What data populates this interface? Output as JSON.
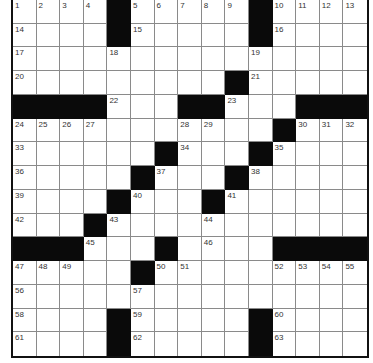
{
  "puzzle": {
    "rows": 15,
    "cols": 15,
    "colors": {
      "block": "#0a0a0a",
      "cell": "#ffffff",
      "gridline": "#8a8a8a",
      "border": "#111111"
    },
    "layout": [
      "....#.....#....",
      "....#.....#....",
      "...............",
      ".........#.....",
      "####...##...###",
      "...........#...",
      "......#...#....",
      ".....#...#.....",
      "....#...#......",
      "...#...........",
      "###...#....####",
      ".....#.........",
      "...............",
      "....#.....#....",
      "....#.....#...."
    ],
    "numbers": [
      {
        "r": 0,
        "c": 0,
        "n": "1"
      },
      {
        "r": 0,
        "c": 1,
        "n": "2"
      },
      {
        "r": 0,
        "c": 2,
        "n": "3"
      },
      {
        "r": 0,
        "c": 3,
        "n": "4"
      },
      {
        "r": 0,
        "c": 5,
        "n": "5"
      },
      {
        "r": 0,
        "c": 6,
        "n": "6"
      },
      {
        "r": 0,
        "c": 7,
        "n": "7"
      },
      {
        "r": 0,
        "c": 8,
        "n": "8"
      },
      {
        "r": 0,
        "c": 9,
        "n": "9"
      },
      {
        "r": 0,
        "c": 11,
        "n": "10"
      },
      {
        "r": 0,
        "c": 12,
        "n": "11"
      },
      {
        "r": 0,
        "c": 13,
        "n": "12"
      },
      {
        "r": 0,
        "c": 14,
        "n": "13"
      },
      {
        "r": 1,
        "c": 0,
        "n": "14"
      },
      {
        "r": 1,
        "c": 5,
        "n": "15"
      },
      {
        "r": 1,
        "c": 11,
        "n": "16"
      },
      {
        "r": 2,
        "c": 0,
        "n": "17"
      },
      {
        "r": 2,
        "c": 4,
        "n": "18"
      },
      {
        "r": 2,
        "c": 10,
        "n": "19"
      },
      {
        "r": 3,
        "c": 0,
        "n": "20"
      },
      {
        "r": 3,
        "c": 10,
        "n": "21"
      },
      {
        "r": 4,
        "c": 4,
        "n": "22"
      },
      {
        "r": 4,
        "c": 9,
        "n": "23"
      },
      {
        "r": 5,
        "c": 0,
        "n": "24"
      },
      {
        "r": 5,
        "c": 1,
        "n": "25"
      },
      {
        "r": 5,
        "c": 2,
        "n": "26"
      },
      {
        "r": 5,
        "c": 3,
        "n": "27"
      },
      {
        "r": 5,
        "c": 7,
        "n": "28"
      },
      {
        "r": 5,
        "c": 8,
        "n": "29"
      },
      {
        "r": 5,
        "c": 12,
        "n": "30"
      },
      {
        "r": 5,
        "c": 13,
        "n": "31"
      },
      {
        "r": 5,
        "c": 14,
        "n": "32"
      },
      {
        "r": 6,
        "c": 0,
        "n": "33"
      },
      {
        "r": 6,
        "c": 7,
        "n": "34"
      },
      {
        "r": 6,
        "c": 11,
        "n": "35"
      },
      {
        "r": 7,
        "c": 0,
        "n": "36"
      },
      {
        "r": 7,
        "c": 6,
        "n": "37"
      },
      {
        "r": 7,
        "c": 10,
        "n": "38"
      },
      {
        "r": 8,
        "c": 0,
        "n": "39"
      },
      {
        "r": 8,
        "c": 5,
        "n": "40"
      },
      {
        "r": 8,
        "c": 9,
        "n": "41"
      },
      {
        "r": 9,
        "c": 0,
        "n": "42"
      },
      {
        "r": 9,
        "c": 4,
        "n": "43"
      },
      {
        "r": 9,
        "c": 8,
        "n": "44"
      },
      {
        "r": 10,
        "c": 3,
        "n": "45"
      },
      {
        "r": 10,
        "c": 8,
        "n": "46"
      },
      {
        "r": 11,
        "c": 0,
        "n": "47"
      },
      {
        "r": 11,
        "c": 1,
        "n": "48"
      },
      {
        "r": 11,
        "c": 2,
        "n": "49"
      },
      {
        "r": 11,
        "c": 6,
        "n": "50"
      },
      {
        "r": 11,
        "c": 7,
        "n": "51"
      },
      {
        "r": 11,
        "c": 11,
        "n": "52"
      },
      {
        "r": 11,
        "c": 12,
        "n": "53"
      },
      {
        "r": 11,
        "c": 13,
        "n": "54"
      },
      {
        "r": 11,
        "c": 14,
        "n": "55"
      },
      {
        "r": 12,
        "c": 0,
        "n": "56"
      },
      {
        "r": 12,
        "c": 5,
        "n": "57"
      },
      {
        "r": 13,
        "c": 0,
        "n": "58"
      },
      {
        "r": 13,
        "c": 5,
        "n": "59"
      },
      {
        "r": 13,
        "c": 11,
        "n": "60"
      },
      {
        "r": 14,
        "c": 0,
        "n": "61"
      },
      {
        "r": 14,
        "c": 5,
        "n": "62"
      },
      {
        "r": 14,
        "c": 11,
        "n": "63"
      }
    ],
    "entries": {}
  }
}
